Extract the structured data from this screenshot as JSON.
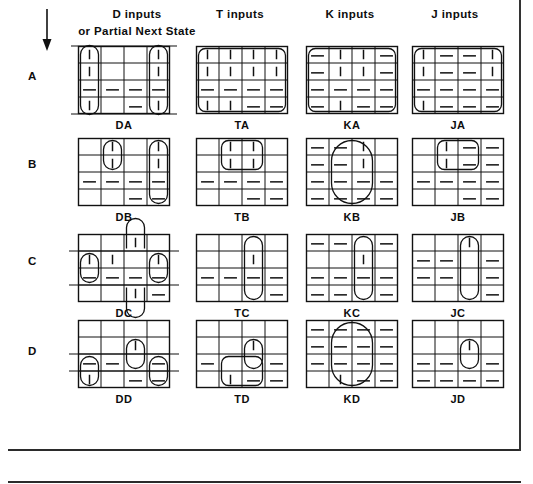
{
  "figure": {
    "kind": "karnaugh-map-array",
    "rows": 4,
    "cols": 4,
    "arrow_icon": "down-arrow-icon",
    "column_headers": [
      {
        "id": "d",
        "title": "D  inputs",
        "subtitle": "or  Partial Next State"
      },
      {
        "id": "t",
        "title": "T inputs",
        "subtitle": ""
      },
      {
        "id": "k",
        "title": "K inputs",
        "subtitle": ""
      },
      {
        "id": "j",
        "title": "J inputs",
        "subtitle": ""
      }
    ],
    "row_labels": [
      "A",
      "B",
      "C",
      "D"
    ]
  },
  "chart_data": {
    "type": "table",
    "xlabel": "",
    "ylabel": "",
    "legend": [
      "| = 1 (vertical tick)",
      "— = don't care / dash",
      "blank = 0"
    ],
    "categories": [
      "D inputs",
      "T inputs",
      "K inputs",
      "J inputs"
    ],
    "rows": [
      "A",
      "B",
      "C",
      "D"
    ],
    "maps": [
      {
        "name": "DA",
        "row": "A",
        "col": "D inputs",
        "cells": [
          [
            "bar",
            "",
            "",
            "bar"
          ],
          [
            "bar",
            "",
            "",
            "bar"
          ],
          [
            "dash",
            "dash",
            "dash",
            "dash"
          ],
          [
            "bar",
            "",
            "dash",
            "bar"
          ]
        ],
        "loops": [
          {
            "shape": "column-wrap",
            "c0": 0,
            "r0": 0,
            "c1": 0,
            "r1": 3
          },
          {
            "shape": "column-wrap",
            "c0": 3,
            "r0": 0,
            "c1": 3,
            "r1": 3
          }
        ],
        "guide_lines": [
          "top-extend",
          "bottom-extend"
        ]
      },
      {
        "name": "TA",
        "row": "A",
        "col": "T inputs",
        "cells": [
          [
            "bar",
            "bar",
            "bar",
            "bar"
          ],
          [
            "bar",
            "bar",
            "bar",
            "bar"
          ],
          [
            "dash",
            "dash",
            "dash",
            "dash"
          ],
          [
            "bar",
            "bar",
            "dash",
            "dash"
          ]
        ],
        "loops": [
          {
            "shape": "rounded",
            "c0": 0,
            "r0": 0,
            "c1": 3,
            "r1": 3
          }
        ],
        "guide_lines": []
      },
      {
        "name": "KA",
        "row": "A",
        "col": "K inputs",
        "cells": [
          [
            "dash",
            "bar",
            "bar",
            "dash"
          ],
          [
            "dash",
            "bar",
            "bar",
            "dash"
          ],
          [
            "dash",
            "dash",
            "dash",
            "dash"
          ],
          [
            "dash",
            "bar",
            "dash",
            "dash"
          ]
        ],
        "loops": [
          {
            "shape": "rounded",
            "c0": 0,
            "r0": 0,
            "c1": 3,
            "r1": 3
          }
        ],
        "guide_lines": []
      },
      {
        "name": "JA",
        "row": "A",
        "col": "J inputs",
        "cells": [
          [
            "bar",
            "dash",
            "dash",
            "bar"
          ],
          [
            "bar",
            "dash",
            "dash",
            "bar"
          ],
          [
            "dash",
            "dash",
            "dash",
            "dash"
          ],
          [
            "bar",
            "dash",
            "dash",
            "dash"
          ]
        ],
        "loops": [
          {
            "shape": "rounded",
            "c0": 0,
            "r0": 0,
            "c1": 3,
            "r1": 3
          }
        ],
        "guide_lines": []
      },
      {
        "name": "DB",
        "row": "B",
        "col": "D inputs",
        "cells": [
          [
            "",
            "bar",
            "",
            "bar"
          ],
          [
            "",
            "bar",
            "",
            "bar"
          ],
          [
            "dash",
            "dash",
            "dash",
            "dash"
          ],
          [
            "",
            "",
            "dash",
            "dash"
          ]
        ],
        "loops": [
          {
            "shape": "oval",
            "c0": 1,
            "r0": 0,
            "c1": 1,
            "r1": 1
          },
          {
            "shape": "oval",
            "c0": 3,
            "r0": 0,
            "c1": 3,
            "r1": 3
          }
        ],
        "guide_lines": []
      },
      {
        "name": "TB",
        "row": "B",
        "col": "T inputs",
        "cells": [
          [
            "",
            "bar",
            "bar",
            ""
          ],
          [
            "",
            "bar",
            "bar",
            ""
          ],
          [
            "dash",
            "dash",
            "dash",
            "dash"
          ],
          [
            "",
            "",
            "dash",
            "dash"
          ]
        ],
        "loops": [
          {
            "shape": "rounded",
            "c0": 1,
            "r0": 0,
            "c1": 2,
            "r1": 1
          }
        ],
        "guide_lines": []
      },
      {
        "name": "KB",
        "row": "B",
        "col": "K inputs",
        "cells": [
          [
            "dash",
            "dash",
            "bar",
            ""
          ],
          [
            "dash",
            "dash",
            "bar",
            ""
          ],
          [
            "dash",
            "dash",
            "dash",
            "dash"
          ],
          [
            "dash",
            "dash",
            "dash",
            "dash"
          ]
        ],
        "loops": [
          {
            "shape": "oval",
            "c0": 1,
            "r0": 0,
            "c1": 2,
            "r1": 3
          }
        ],
        "guide_lines": []
      },
      {
        "name": "JB",
        "row": "B",
        "col": "J inputs",
        "cells": [
          [
            "",
            "bar",
            "dash",
            "dash"
          ],
          [
            "",
            "bar",
            "dash",
            "dash"
          ],
          [
            "dash",
            "dash",
            "dash",
            "dash"
          ],
          [
            "",
            "",
            "dash",
            "dash"
          ]
        ],
        "loops": [
          {
            "shape": "rounded",
            "c0": 1,
            "r0": 0,
            "c1": 2,
            "r1": 1
          }
        ],
        "guide_lines": []
      },
      {
        "name": "DC",
        "row": "C",
        "col": "D inputs",
        "cells": [
          [
            "",
            "",
            "bar",
            ""
          ],
          [
            "bar",
            "bar",
            "",
            "bar"
          ],
          [
            "dash",
            "dash",
            "dash",
            "dash"
          ],
          [
            "",
            "",
            "bar",
            "dash"
          ]
        ],
        "loops": [
          {
            "shape": "oval",
            "c0": 0,
            "r0": 1,
            "c1": 0,
            "r1": 2
          },
          {
            "shape": "oval",
            "c0": 3,
            "r0": 1,
            "c1": 3,
            "r1": 2
          },
          {
            "shape": "oval-up",
            "c0": 2,
            "r0": 0,
            "c1": 2,
            "r1": 0
          },
          {
            "shape": "oval-down",
            "c0": 2,
            "r0": 3,
            "c1": 2,
            "r1": 3
          }
        ],
        "guide_lines": [
          "mid-extend-top",
          "mid-extend-bottom"
        ]
      },
      {
        "name": "TC",
        "row": "C",
        "col": "T inputs",
        "cells": [
          [
            "",
            "",
            "",
            ""
          ],
          [
            "",
            "",
            "bar",
            ""
          ],
          [
            "dash",
            "dash",
            "dash",
            "dash"
          ],
          [
            "",
            "",
            "",
            "dash"
          ]
        ],
        "loops": [
          {
            "shape": "oval",
            "c0": 2,
            "r0": 0,
            "c1": 2,
            "r1": 3
          }
        ],
        "guide_lines": []
      },
      {
        "name": "KC",
        "row": "C",
        "col": "K inputs",
        "cells": [
          [
            "dash",
            "dash",
            "",
            "dash"
          ],
          [
            "",
            "",
            "bar",
            ""
          ],
          [
            "dash",
            "dash",
            "dash",
            "dash"
          ],
          [
            "dash",
            "dash",
            "",
            "dash"
          ]
        ],
        "loops": [
          {
            "shape": "oval",
            "c0": 2,
            "r0": 0,
            "c1": 2,
            "r1": 3
          }
        ],
        "guide_lines": []
      },
      {
        "name": "JC",
        "row": "C",
        "col": "J inputs",
        "cells": [
          [
            "",
            "",
            "bar",
            ""
          ],
          [
            "dash",
            "dash",
            "",
            "dash"
          ],
          [
            "dash",
            "dash",
            "",
            "dash"
          ],
          [
            "",
            "",
            "",
            "dash"
          ]
        ],
        "loops": [
          {
            "shape": "oval",
            "c0": 2,
            "r0": 0,
            "c1": 2,
            "r1": 3
          }
        ],
        "guide_lines": []
      },
      {
        "name": "DD",
        "row": "D",
        "col": "D inputs",
        "cells": [
          [
            "",
            "",
            "",
            ""
          ],
          [
            "",
            "",
            "bar",
            ""
          ],
          [
            "dash",
            "dash",
            "",
            "dash"
          ],
          [
            "bar",
            "",
            "dash",
            "dash"
          ]
        ],
        "loops": [
          {
            "shape": "oval",
            "c0": 2,
            "r0": 1,
            "c1": 2,
            "r1": 2
          },
          {
            "shape": "oval",
            "c0": 0,
            "r0": 2,
            "c1": 0,
            "r1": 3
          },
          {
            "shape": "oval",
            "c0": 3,
            "r0": 2,
            "c1": 3,
            "r1": 3
          }
        ],
        "guide_lines": [
          "mid-extend-left",
          "mid-extend-right"
        ]
      },
      {
        "name": "TD",
        "row": "D",
        "col": "T inputs",
        "cells": [
          [
            "",
            "",
            "",
            ""
          ],
          [
            "",
            "",
            "bar",
            ""
          ],
          [
            "dash",
            "",
            "",
            "dash"
          ],
          [
            "",
            "bar",
            "dash",
            "dash"
          ]
        ],
        "loops": [
          {
            "shape": "oval",
            "c0": 2,
            "r0": 1,
            "c1": 2,
            "r1": 2
          },
          {
            "shape": "rounded",
            "c0": 1,
            "r0": 2,
            "c1": 2,
            "r1": 3
          }
        ],
        "guide_lines": []
      },
      {
        "name": "KD",
        "row": "D",
        "col": "K inputs",
        "cells": [
          [
            "dash",
            "dash",
            "dash",
            "dash"
          ],
          [
            "dash",
            "dash",
            "dash",
            "dash"
          ],
          [
            "dash",
            "dash",
            "dash",
            "dash"
          ],
          [
            "",
            "bar",
            "dash",
            "dash"
          ]
        ],
        "loops": [
          {
            "shape": "oval",
            "c0": 1,
            "r0": 0,
            "c1": 2,
            "r1": 3
          }
        ],
        "guide_lines": []
      },
      {
        "name": "JD",
        "row": "D",
        "col": "J inputs",
        "cells": [
          [
            "",
            "",
            "",
            ""
          ],
          [
            "",
            "",
            "bar",
            ""
          ],
          [
            "dash",
            "dash",
            "",
            "dash"
          ],
          [
            "dash",
            "dash",
            "dash",
            "dash"
          ]
        ],
        "loops": [
          {
            "shape": "oval",
            "c0": 2,
            "r0": 1,
            "c1": 2,
            "r1": 2
          }
        ],
        "guide_lines": []
      }
    ]
  }
}
